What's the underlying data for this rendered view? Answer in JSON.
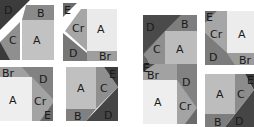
{
  "colors": {
    "A_light": "#eeeeee",
    "A_mid": "#bdbdbd",
    "B": "#8a8a8a",
    "C": "#9a9a9a",
    "Cr": "#a8a8a8",
    "D": "#4a4a4a",
    "D_mid": "#6e6e6e",
    "E": "#5a5a5a",
    "gap": "#ffffff"
  },
  "blocks": [
    {
      "id": "left-top-left",
      "labels": {
        "D": "D",
        "B": "B",
        "C": "C",
        "A": "A"
      }
    },
    {
      "id": "left-top-right",
      "labels": {
        "E": "E",
        "Cr": "Cr",
        "A": "A",
        "D": "D",
        "Br": "Br"
      }
    },
    {
      "id": "left-bottom-left",
      "labels": {
        "Br": "Br",
        "D": "D",
        "A": "A",
        "Cr": "Cr",
        "E": "E"
      }
    },
    {
      "id": "left-bottom-right",
      "labels": {
        "A": "A",
        "C": "C",
        "E": "E",
        "B": "B",
        "D": "D"
      }
    },
    {
      "id": "right-top-left",
      "labels": {
        "D": "D",
        "B": "B",
        "C": "C",
        "A": "A",
        "E": "E"
      }
    },
    {
      "id": "right-top-right",
      "labels": {
        "E": "E",
        "Cr": "Cr",
        "A": "A",
        "D": "D",
        "Br": "Br"
      }
    },
    {
      "id": "right-bottom-left",
      "labels": {
        "E": "E",
        "Br": "Br",
        "D": "D",
        "A": "A",
        "Cr": "Cr"
      }
    },
    {
      "id": "right-bottom-right",
      "labels": {
        "A": "A",
        "C": "C",
        "E": "E",
        "B": "B",
        "D": "D"
      }
    }
  ]
}
